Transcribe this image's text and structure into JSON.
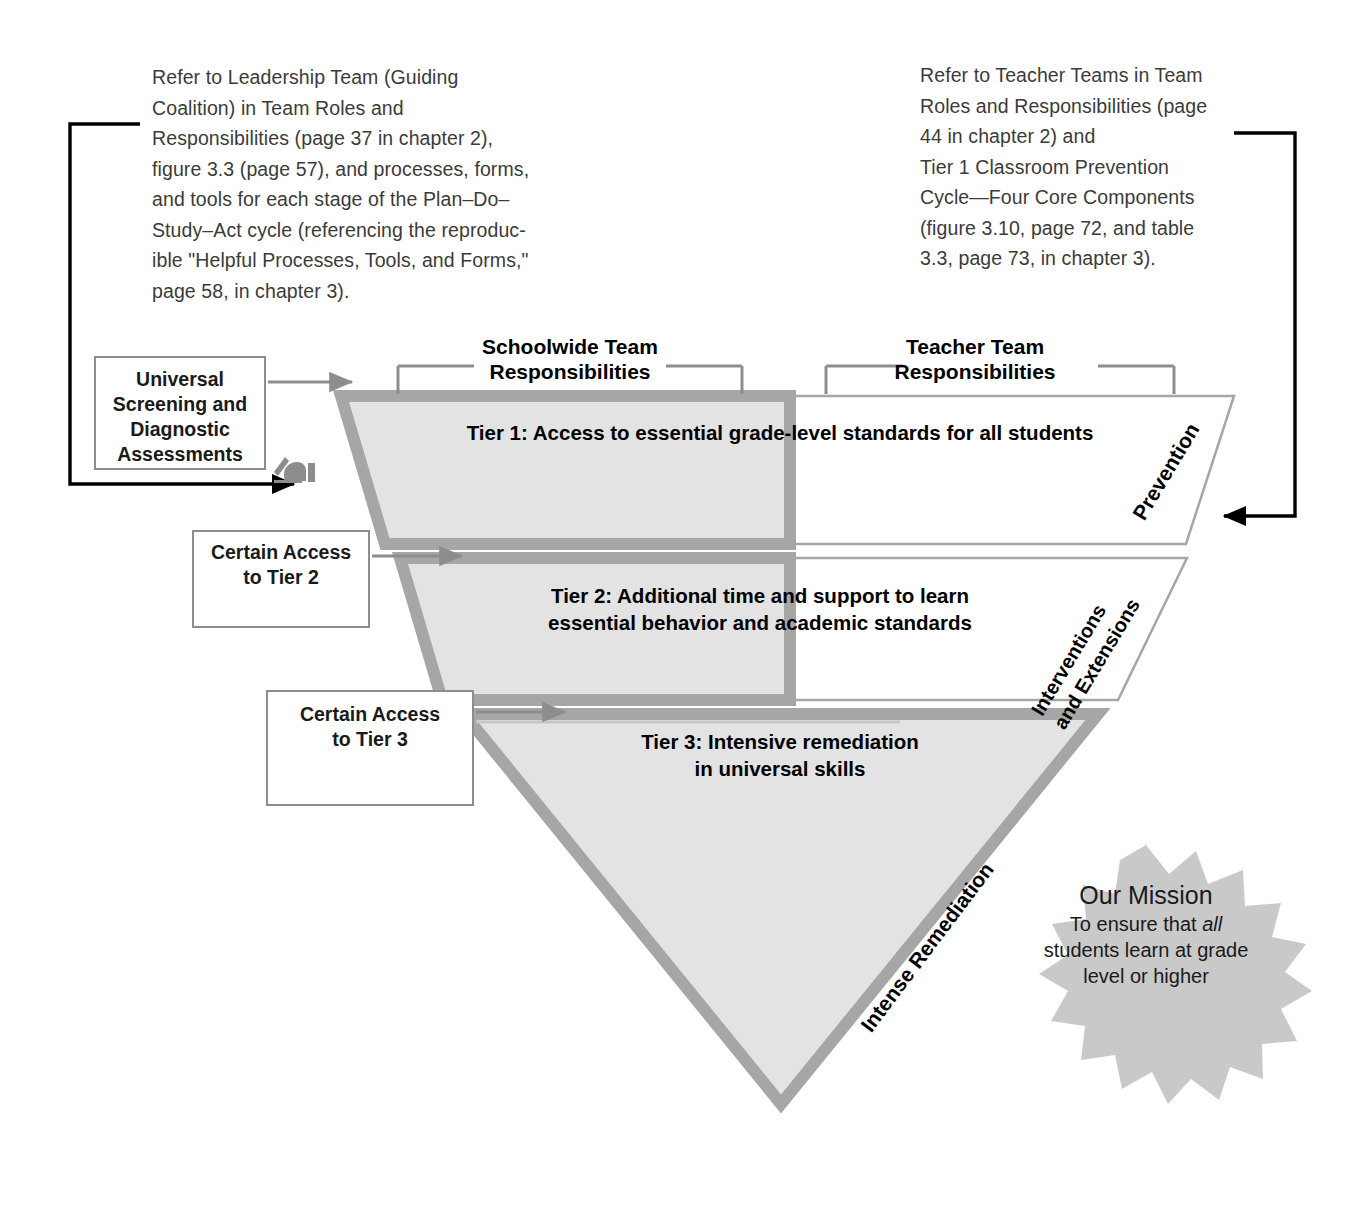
{
  "captions": {
    "left": "Refer to Leadership Team (Guiding\nCoalition) in Team Roles and\nResponsibilities (page 37 in chapter 2),\nfigure 3.3 (page 57), and processes, forms,\nand tools for each stage of the Plan–Do–\nStudy–Act cycle (referencing the reproduc-\nible \"Helpful Processes, Tools, and Forms,\"\npage 58, in chapter 3).",
    "right": "Refer to Teacher Teams in Team\nRoles and Responsibilities (page\n44 in chapter 2) and\nTier 1 Classroom Prevention\nCycle—Four Core Components\n(figure 3.10, page 72, and table\n3.3, page 73, in chapter 3)."
  },
  "stage_boxes": [
    {
      "id": "universal",
      "label": "Universal\nScreening and\nDiagnostic\nAssessments"
    },
    {
      "id": "tier2",
      "label": "Certain Access\nto Tier 2"
    },
    {
      "id": "tier3",
      "label": "Certain Access\nto Tier 3"
    }
  ],
  "team_headers": {
    "schoolwide": "Schoolwide Team\nResponsibilities",
    "teacher": "Teacher Team\nResponsibilities"
  },
  "tiers": [
    {
      "id": "tier1",
      "label": "Tier 1: Access to essential grade-level standards for all students",
      "edge_label": "Prevention"
    },
    {
      "id": "tier2",
      "label": "Tier 2: Additional time and support to learn\nessential behavior and academic standards",
      "edge_label": "Interventions\nand Extensions"
    },
    {
      "id": "tier3",
      "label": "Tier 3: Intensive remediation\nin universal skills",
      "edge_label": "Intense Remediation"
    }
  ],
  "mission": {
    "title": "Our Mission",
    "line1": "To ensure that ",
    "emphasis": "all",
    "line2": "students learn at grade",
    "line3": "level or higher"
  },
  "icons": {
    "writing_hand": "writing-hand-icon"
  },
  "colors": {
    "tier_fill": "#e3e3e3",
    "tier_stroke": "#a6a6a6",
    "box_border": "#8d8d8d",
    "connector_gray": "#8d8d8d",
    "connector_black": "#000000",
    "starburst_fill": "#c9c9c9",
    "caption_text": "#3b3b3b",
    "body_text": "#1a1a1a"
  }
}
